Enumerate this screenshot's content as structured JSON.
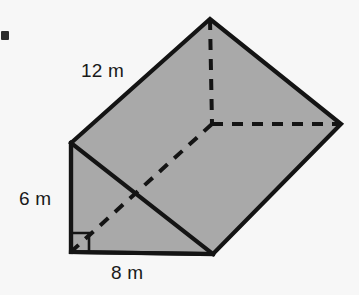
{
  "figure": {
    "name": "triangular-prism-diagram",
    "shape": "triangular prism",
    "fill_color": "#a9a9a9",
    "stroke_color": "#141414",
    "background_color": "#f7f7f7",
    "labels": {
      "length": "12 m",
      "height": "6 m",
      "base": "8 m"
    },
    "right_angle_marker": "right-angle-square",
    "vertices": {
      "front_top_left": [
        71,
        143
      ],
      "front_bottom_left": [
        71,
        252
      ],
      "front_bottom_right": [
        213,
        254
      ],
      "back_apex": [
        210,
        19
      ],
      "back_right": [
        341,
        124
      ],
      "hidden_back_bottom": [
        212,
        124
      ]
    },
    "hidden_edges": [
      "apex-to-hidden-vertex",
      "hidden-vertex-to-back-right",
      "hidden-vertex-to-front-bottom-left"
    ]
  },
  "artifacts": {
    "bullet": "square-bullet-marker",
    "ghost_lines": [
      "",
      "",
      ""
    ]
  }
}
